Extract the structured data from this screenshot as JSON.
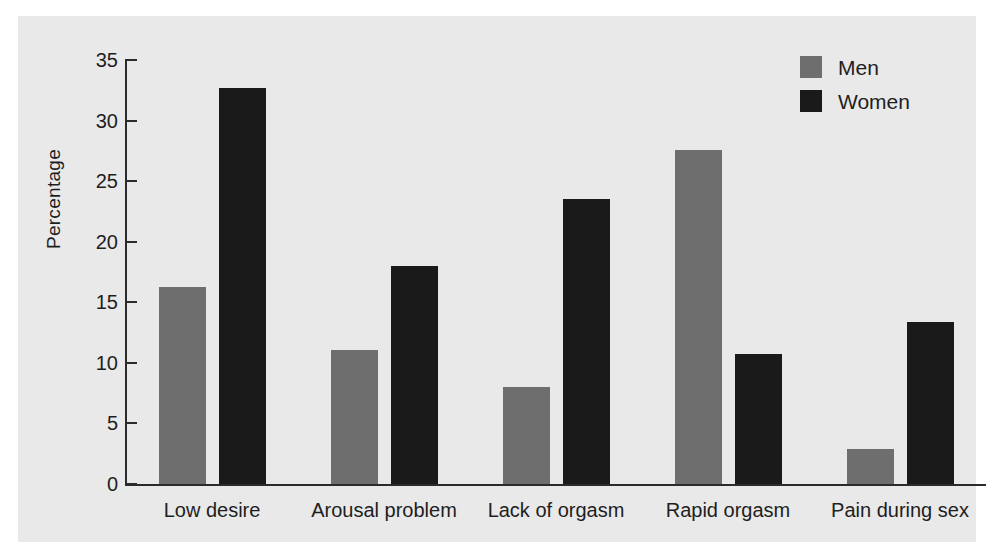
{
  "chart_data": {
    "type": "bar",
    "title": "",
    "xlabel": "",
    "ylabel": "Percentage",
    "ylim": [
      0,
      35
    ],
    "yticks": [
      0,
      5,
      10,
      15,
      20,
      25,
      30,
      35
    ],
    "ytick_labels": [
      "0",
      "5",
      "10",
      "15",
      "20",
      "25",
      "30",
      "35"
    ],
    "grid": false,
    "legend_position": "top-right",
    "categories": [
      "Low desire",
      "Arousal problem",
      "Lack of orgasm",
      "Rapid orgasm",
      "Pain during sex"
    ],
    "series": [
      {
        "name": "Men",
        "color": "#6e6e6e",
        "values": [
          16.3,
          11.1,
          8.0,
          27.6,
          2.9
        ]
      },
      {
        "name": "Women",
        "color": "#1a1a1a",
        "values": [
          32.7,
          18.0,
          23.5,
          10.7,
          13.4
        ]
      }
    ]
  },
  "legend": {
    "items": [
      {
        "label": "Men",
        "color": "#6e6e6e"
      },
      {
        "label": "Women",
        "color": "#1a1a1a"
      }
    ]
  },
  "colors": {
    "men": "#6e6e6e",
    "women": "#1a1a1a",
    "panel_background": "#e9e9e9",
    "axis": "#2b2b2b",
    "text": "#1e1e1e",
    "figure_background": "#ffffff"
  }
}
